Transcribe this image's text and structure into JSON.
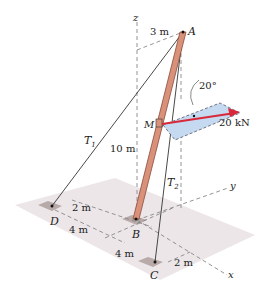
{
  "diagram": {
    "labels": {
      "z_axis": "z",
      "y_axis": "y",
      "x_axis": "x",
      "point_A": "A",
      "point_B": "B",
      "point_C": "C",
      "point_D": "D",
      "point_M": "M",
      "T1_main": "T",
      "T1_sub": "1",
      "T2_main": "T",
      "T2_sub": "2",
      "dim_3m": "3 m",
      "dim_10m": "10 m",
      "dim_D_2m": "2 m",
      "dim_D_4m": "4 m",
      "dim_C_4m": "4 m",
      "dim_C_2m": "2 m",
      "angle": "20°",
      "force": "20 kN"
    },
    "colors": {
      "pole": "#d9917a",
      "pole_edge": "#8a4a3a",
      "force_arrow": "#d8283a",
      "force_plane": "#c5d9f1",
      "ground": "#ece6e8",
      "anchor": "#b8aaa8"
    }
  }
}
